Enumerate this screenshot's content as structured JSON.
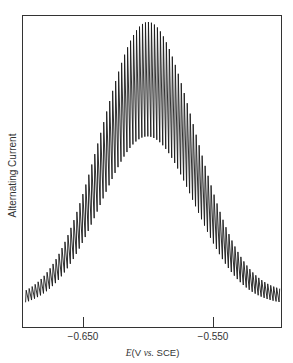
{
  "chart_data": {
    "type": "line",
    "title": "",
    "xlabel": "E (V vs. SCE)",
    "xlabel_parts": {
      "var": "E",
      "unit": "(V ",
      "vs": "vs.",
      "ref": " SCE)"
    },
    "ylabel": "Alternating Current",
    "xlim": [
      -0.697,
      -0.498
    ],
    "x_ticks": [
      {
        "value": -0.65,
        "label": "−0.650"
      },
      {
        "value": -0.55,
        "label": "−0.550"
      }
    ],
    "grid": false,
    "legend": null,
    "series": [
      {
        "name": "ac polarogram (oscillating)",
        "description": "Bell-shaped AC polarographic peak with rapid oscillations (drop-time modulation)",
        "peak_potential": -0.601,
        "sigma_V": 0.036,
        "upper_envelope": {
          "baseline_left": 0.03,
          "baseline_right": 0.05,
          "peak": 1.0
        },
        "lower_envelope": {
          "baseline_left": 0.0,
          "baseline_right": 0.01,
          "peak": 0.6
        },
        "oscillation_period_V": 0.0023
      }
    ],
    "y_units": "arbitrary"
  },
  "axes": {
    "ylabel": "Alternating Current",
    "tick_labels": [
      "−0.650",
      "−0.550"
    ]
  }
}
